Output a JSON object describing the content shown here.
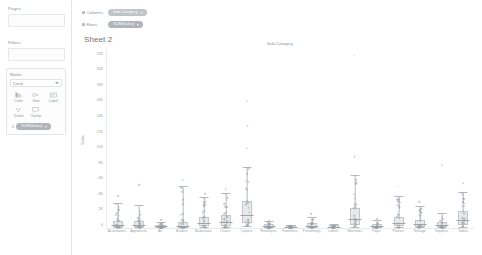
{
  "sidebar": {
    "pages": {
      "title": "Pages"
    },
    "filters": {
      "title": "Filters"
    },
    "marks": {
      "title": "Marks",
      "mark_type": "Circle",
      "buttons": [
        {
          "name": "color",
          "label": "Color",
          "glyph": "color-icon"
        },
        {
          "name": "size",
          "label": "Size",
          "glyph": "size-icon"
        },
        {
          "name": "label",
          "label": "Label",
          "glyph": "label-icon"
        },
        {
          "name": "detail",
          "label": "Detail",
          "glyph": "detail-icon"
        },
        {
          "name": "tooltip",
          "label": "Tooltip",
          "glyph": "tooltip-icon"
        }
      ],
      "field_pill": "SUM(Sales)"
    }
  },
  "shelves": {
    "columns_label": "Columns",
    "rows_label": "Rows",
    "columns_pill": "Sub-Category",
    "rows_pill": "SUM(Sales)"
  },
  "sheet": {
    "title": "Sheet 2"
  },
  "colors": {
    "mark": "#9aa0a5",
    "box_fill": "#b0b5b9",
    "axis": "#e8eaec",
    "dimension_pill": "#bfc4c8",
    "measure_pill": "#aeb4b9",
    "text": "#8b9196"
  },
  "chart_data": {
    "type": "scatter",
    "title": "Sub-Category",
    "xlabel": "",
    "ylabel": "Sales",
    "grid": false,
    "legend": "none",
    "ylim": [
      0,
      23000
    ],
    "yticks": [
      0,
      2000,
      4000,
      6000,
      8000,
      10000,
      12000,
      14000,
      16000,
      18000,
      20000,
      22000
    ],
    "ytick_labels": [
      "0",
      "2K",
      "4K",
      "6K",
      "8K",
      "10K",
      "12K",
      "14K",
      "16K",
      "18K",
      "20K",
      "22K"
    ],
    "categories": [
      "Accessories",
      "Appliances",
      "Art",
      "Binders",
      "Bookcases",
      "Chairs",
      "Copiers",
      "Envelopes",
      "Fasteners",
      "Furnishings",
      "Labels",
      "Machines",
      "Paper",
      "Phones",
      "Storage",
      "Supplies",
      "Tables"
    ],
    "series": [
      {
        "name": "Sales distribution",
        "stats": [
          {
            "category": "Accessories",
            "min": 20,
            "q1": 110,
            "median": 300,
            "q3": 700,
            "max": 3200,
            "outliers": [
              4200
            ]
          },
          {
            "category": "Appliances",
            "min": 15,
            "q1": 100,
            "median": 260,
            "q3": 620,
            "max": 2900,
            "outliers": [
              5600
            ]
          },
          {
            "category": "Art",
            "min": 10,
            "q1": 40,
            "median": 90,
            "q3": 190,
            "max": 750,
            "outliers": [
              1100
            ]
          },
          {
            "category": "Binders",
            "min": 8,
            "q1": 60,
            "median": 180,
            "q3": 520,
            "max": 5400,
            "outliers": [
              6200
            ]
          },
          {
            "category": "Bookcases",
            "min": 40,
            "q1": 230,
            "median": 560,
            "q3": 1150,
            "max": 3900,
            "outliers": [
              4400
            ]
          },
          {
            "category": "Chairs",
            "min": 35,
            "q1": 260,
            "median": 640,
            "q3": 1400,
            "max": 4500,
            "outliers": [
              5100
            ]
          },
          {
            "category": "Copiers",
            "min": 200,
            "q1": 700,
            "median": 1600,
            "q3": 3200,
            "max": 7800,
            "outliers": [
              10300,
              13200,
              16400
            ]
          },
          {
            "category": "Envelopes",
            "min": 10,
            "q1": 45,
            "median": 110,
            "q3": 230,
            "max": 760,
            "outliers": [
              1000
            ]
          },
          {
            "category": "Fasteners",
            "min": 5,
            "q1": 20,
            "median": 45,
            "q3": 90,
            "max": 290,
            "outliers": []
          },
          {
            "category": "Furnishings",
            "min": 8,
            "q1": 55,
            "median": 140,
            "q3": 330,
            "max": 1300,
            "outliers": [
              1800
            ]
          },
          {
            "category": "Labels",
            "min": 5,
            "q1": 25,
            "median": 60,
            "q3": 130,
            "max": 420,
            "outliers": []
          },
          {
            "category": "Machines",
            "min": 60,
            "q1": 400,
            "median": 1000,
            "q3": 2300,
            "max": 6800,
            "outliers": [
              9200,
              22300
            ]
          },
          {
            "category": "Paper",
            "min": 8,
            "q1": 45,
            "median": 110,
            "q3": 250,
            "max": 900,
            "outliers": [
              1200
            ]
          },
          {
            "category": "Phones",
            "min": 30,
            "q1": 200,
            "median": 520,
            "q3": 1150,
            "max": 4100,
            "outliers": [
              5400
            ]
          },
          {
            "category": "Storage",
            "min": 20,
            "q1": 160,
            "median": 380,
            "q3": 830,
            "max": 2800,
            "outliers": [
              3400
            ]
          },
          {
            "category": "Supplies",
            "min": 15,
            "q1": 90,
            "median": 220,
            "q3": 480,
            "max": 1900,
            "outliers": [
              8100
            ]
          },
          {
            "category": "Tables",
            "min": 50,
            "q1": 400,
            "median": 900,
            "q3": 1900,
            "max": 4600,
            "outliers": [
              5800
            ]
          }
        ]
      }
    ]
  }
}
